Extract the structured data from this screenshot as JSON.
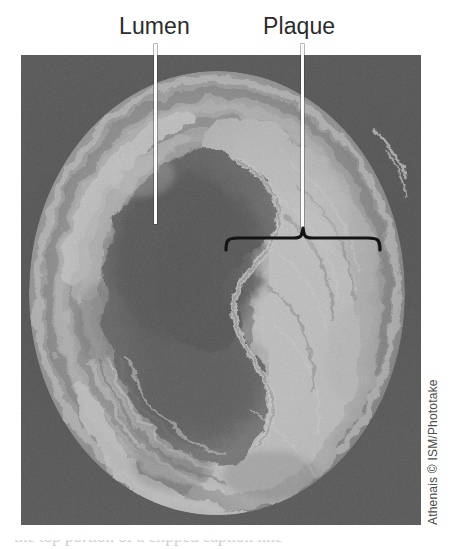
{
  "figure": {
    "type": "annotated-photograph",
    "background_color": "#ffffff"
  },
  "labels": {
    "lumen": "Lumen",
    "plaque": "Plaque"
  },
  "annotations": {
    "leader_line_color": "#fbfbfb",
    "brace_color": "#1a1a1a",
    "label_color": "#2b2b2b"
  },
  "credit": {
    "text": "Athenais © ISM/Phototake",
    "color": "#4b4b4b",
    "orientation": "vertical-rotated-90"
  },
  "bottom_sliver": {
    "text": "the top portion of a clipped caption line"
  },
  "photo": {
    "palette": {
      "background_dark": "#3c3c3c",
      "vessel_wall_mid": "#8d8d8d",
      "plaque_bright": "#efefef",
      "lumen_dark": "#4e4e4e",
      "lumen_core": "#3f3f3f",
      "highlight": "#fdfdfd"
    },
    "regions": [
      {
        "name": "lumen",
        "description": "dark irregular channel left of centre"
      },
      {
        "name": "plaque",
        "description": "bright thickened mass occupying the right and lower wall"
      },
      {
        "name": "vessel-wall",
        "description": "concentric grey lamellar rings around the lumen"
      }
    ]
  }
}
